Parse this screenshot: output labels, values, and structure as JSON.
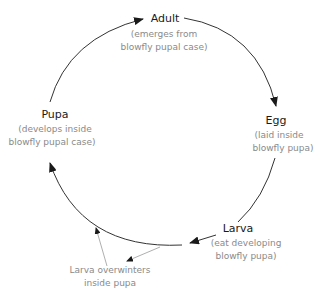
{
  "diagram": {
    "type": "life-cycle",
    "stages": [
      {
        "id": "adult",
        "title": "Adult",
        "desc_lines": [
          "(emerges from",
          "blowfly pupal case)"
        ]
      },
      {
        "id": "egg",
        "title": "Egg",
        "desc_lines": [
          "(laid inside",
          "blowfly pupa)"
        ]
      },
      {
        "id": "larva",
        "title": "Larva",
        "desc_lines": [
          "(eat developing",
          "blowfly pupa)"
        ]
      },
      {
        "id": "pupa",
        "title": "Pupa",
        "desc_lines": [
          "(develops inside",
          "blowfly pupal case)"
        ]
      }
    ],
    "note": {
      "lines": [
        "Larva overwinters",
        "inside pupa"
      ]
    },
    "colors": {
      "main_arrow": "#1a1a1a",
      "note_arrow": "#9a9a9a",
      "title": "#1a1a1a",
      "desc": "#8a8a8a"
    }
  }
}
